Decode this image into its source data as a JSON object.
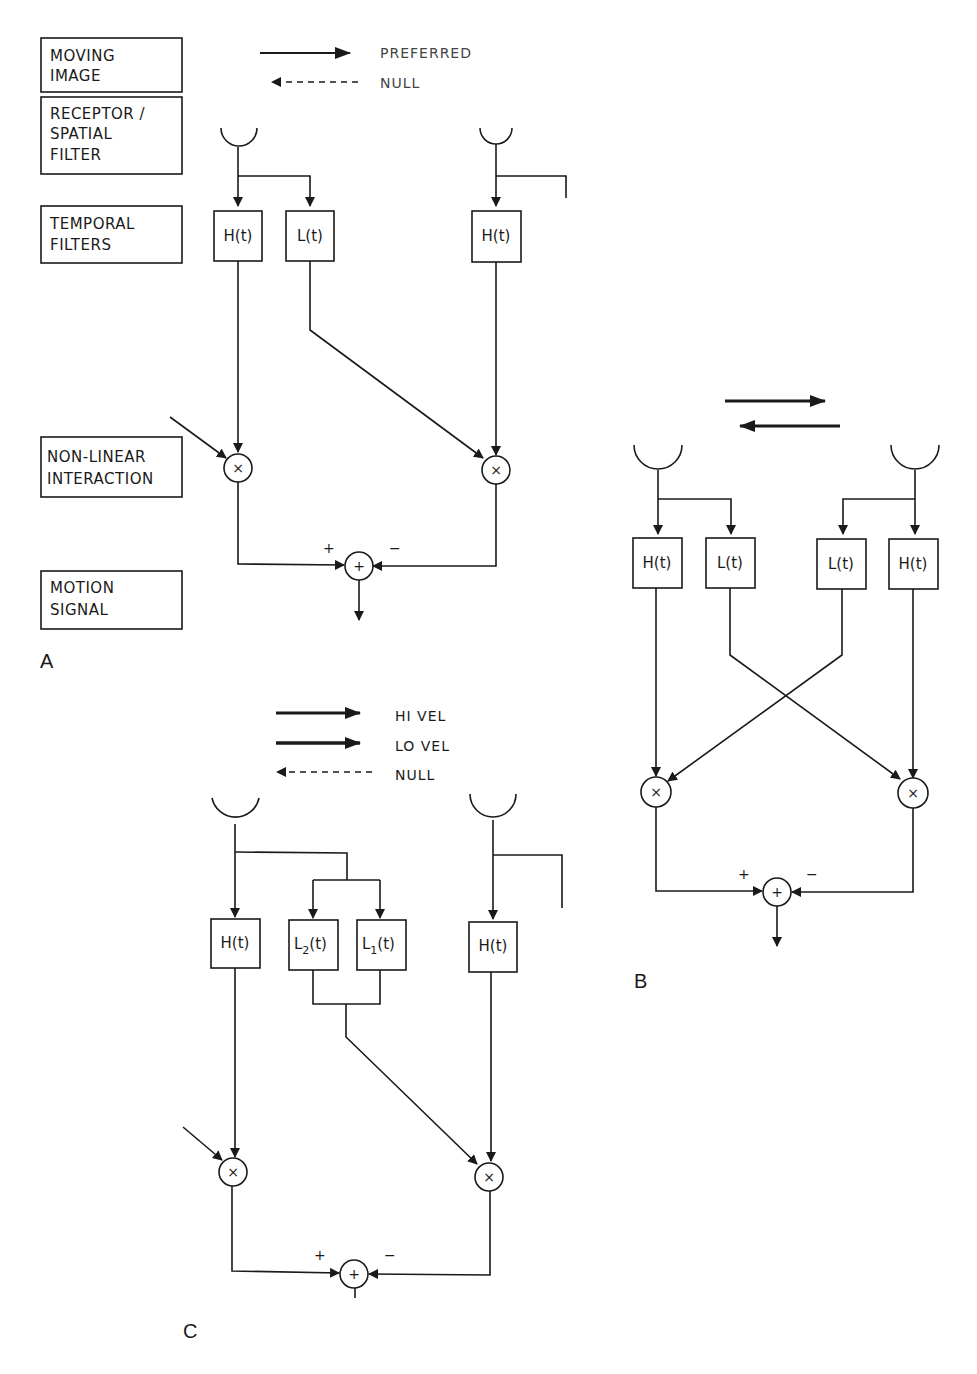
{
  "row_labels": [
    {
      "lines": [
        "MOVING",
        "IMAGE"
      ]
    },
    {
      "lines": [
        "RECEPTOR /",
        "SPATIAL",
        "FILTER"
      ]
    },
    {
      "lines": [
        "TEMPORAL",
        "FILTERS"
      ]
    },
    {
      "lines": [
        "NON-LINEAR",
        "INTERACTION"
      ]
    },
    {
      "lines": [
        "MOTION",
        "SIGNAL"
      ]
    }
  ],
  "panel_a": {
    "label": "A",
    "legend": {
      "preferred": "PREFERRED",
      "null": "NULL"
    },
    "filters": {
      "h_left": "H(t)",
      "l_left": "L(t)",
      "h_right": "H(t)"
    },
    "multiply": "×",
    "sum": "+",
    "sign_plus": "+",
    "sign_minus": "−"
  },
  "panel_b": {
    "label": "B",
    "filters": {
      "h1": "H(t)",
      "l1": "L(t)",
      "l2": "L(t)",
      "h2": "H(t)"
    },
    "multiply": "×",
    "sum": "+",
    "sign_plus": "+",
    "sign_minus": "−"
  },
  "panel_c": {
    "label": "C",
    "legend": {
      "hi": "HI VEL",
      "lo": "LO VEL",
      "null": "NULL"
    },
    "filters": {
      "h_left": "H(t)",
      "l2": "L",
      "l2_sub": "2",
      "l1": "L",
      "l1_sub": "1",
      "arg": "(t)",
      "h_right": "H(t)"
    },
    "multiply": "×",
    "sum": "+",
    "sign_plus": "+",
    "sign_minus": "−"
  }
}
